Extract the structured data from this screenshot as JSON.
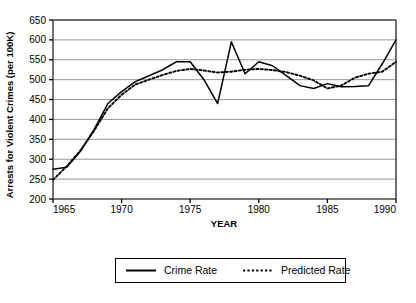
{
  "chart_data": {
    "type": "line",
    "title": "",
    "xlabel": "YEAR",
    "ylabel": "Arrests for Violent Crimes (per 100K)",
    "xlim": [
      1965,
      1990
    ],
    "ylim": [
      200,
      650
    ],
    "xticks": [
      1965,
      1970,
      1975,
      1980,
      1985,
      1990
    ],
    "yticks": [
      200,
      250,
      300,
      350,
      400,
      450,
      500,
      550,
      600,
      650
    ],
    "grid": "horizontal",
    "legend_position": "bottom-outside",
    "x": [
      1965,
      1966,
      1967,
      1968,
      1969,
      1970,
      1971,
      1972,
      1973,
      1974,
      1975,
      1976,
      1977,
      1978,
      1979,
      1980,
      1981,
      1982,
      1983,
      1984,
      1985,
      1986,
      1987,
      1988,
      1989,
      1990
    ],
    "series": [
      {
        "name": "Crime Rate",
        "style": "solid",
        "color": "#000000",
        "values": [
          275,
          280,
          320,
          375,
          440,
          470,
          495,
          510,
          525,
          545,
          545,
          500,
          440,
          595,
          515,
          545,
          535,
          510,
          485,
          478,
          490,
          482,
          483,
          485,
          540,
          600
        ]
      },
      {
        "name": "Predicted Rate",
        "style": "dotted",
        "color": "#000000",
        "values": [
          248,
          282,
          322,
          372,
          428,
          462,
          488,
          500,
          512,
          522,
          527,
          523,
          518,
          520,
          525,
          527,
          524,
          519,
          510,
          498,
          478,
          485,
          505,
          515,
          520,
          545
        ]
      }
    ]
  },
  "axes": {
    "y_label": "Arrests for Violent Crimes (per 100K)",
    "x_label": "YEAR",
    "y_ticks": [
      "650",
      "600",
      "550",
      "500",
      "450",
      "400",
      "350",
      "300",
      "250",
      "200"
    ],
    "x_ticks": [
      "1965",
      "1970",
      "1975",
      "1980",
      "1985",
      "1990"
    ]
  },
  "legend": {
    "items": [
      {
        "label": "Crime Rate",
        "style": "solid"
      },
      {
        "label": "Predicted Rate",
        "style": "dotted"
      }
    ]
  },
  "caption": {
    "partial_text": ""
  },
  "colors": {
    "line": "#000000",
    "grid": "#8c8c8c",
    "frame": "#4d4d4d",
    "background": "#ffffff"
  }
}
